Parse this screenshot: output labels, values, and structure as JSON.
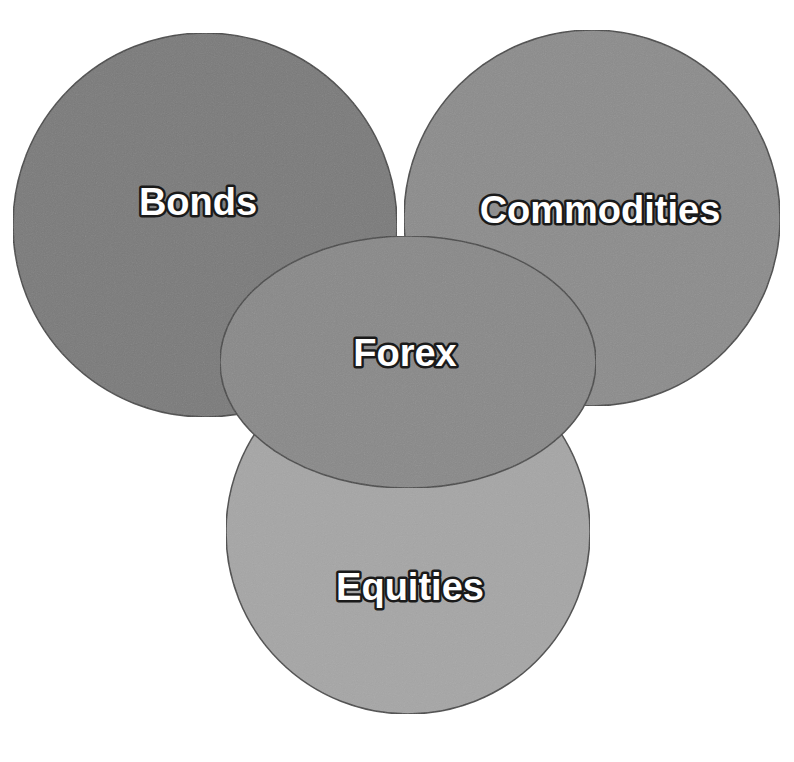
{
  "diagram": {
    "type": "overlapping-circles",
    "nodes": [
      {
        "id": "bonds",
        "label": "Bonds",
        "fill": "#7a7a7a"
      },
      {
        "id": "commodities",
        "label": "Commodities",
        "fill": "#8c8c8c"
      },
      {
        "id": "equities",
        "label": "Equities",
        "fill": "#a6a6a6"
      },
      {
        "id": "forex",
        "label": "Forex",
        "fill": "#898989"
      }
    ],
    "outline_color": "#4a4a4a",
    "text_color": "#ffffff",
    "text_outline_color": "#1a1a1a"
  }
}
